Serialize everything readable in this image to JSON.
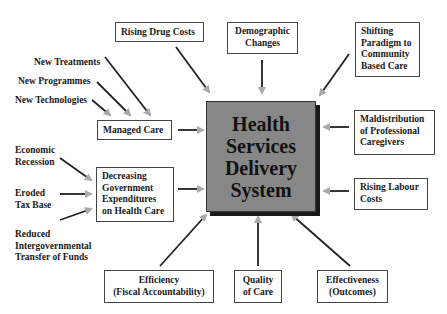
{
  "center": {
    "title_lines": [
      "Health",
      "Services",
      "Delivery",
      "System"
    ]
  },
  "boxes": {
    "rising_drug_costs": "Rising Drug Costs",
    "demographic_changes": [
      "Demographic",
      "Changes"
    ],
    "shifting_paradigm": [
      "Shifting",
      "Paradigm to",
      "Community",
      "Based Care"
    ],
    "managed_care": "Managed Care",
    "maldistribution": [
      "Maldistribution",
      "of Professional",
      "Caregivers"
    ],
    "decreasing_gov": [
      "Decreasing",
      "Government",
      "Expenditures",
      "on Health Care"
    ],
    "rising_labour": [
      "Rising Labour",
      "Costs"
    ],
    "efficiency": [
      "Efficiency",
      "(Fiscal Accountability)"
    ],
    "quality": [
      "Quality",
      "of Care"
    ],
    "effectiveness": [
      "Effectiveness",
      "(Outcomes)"
    ]
  },
  "labels": {
    "new_treatments": "New Treatments",
    "new_programmes": "New Programmes",
    "new_technologies": "New Technologies",
    "economic_recession": [
      "Economic",
      "Recession"
    ],
    "eroded_tax_base": [
      "Eroded",
      "Tax Base"
    ],
    "reduced_transfer": [
      "Reduced",
      "Intergovernmental",
      "Transfer of Funds"
    ]
  },
  "colors": {
    "core_fill": "#878787",
    "arrow_shaft": "#222222",
    "arrow_head": "#b0b0b0"
  }
}
